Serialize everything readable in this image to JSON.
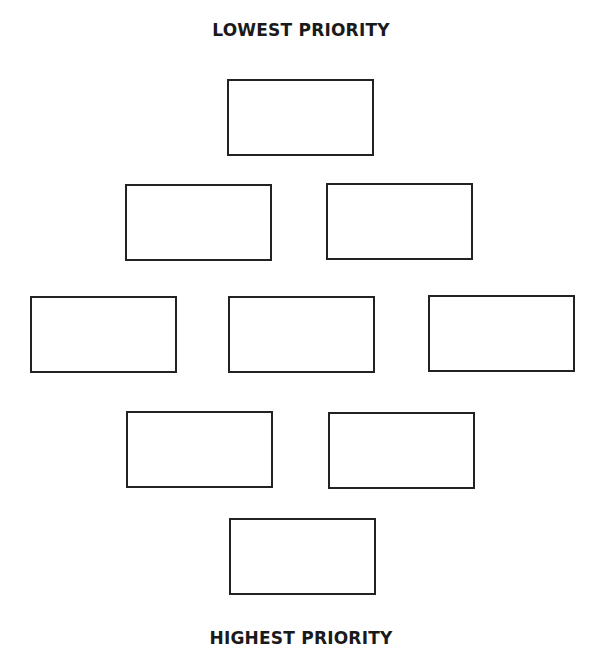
{
  "diagram": {
    "top_label": "LOWEST PRIORITY",
    "bottom_label": "HIGHEST PRIORITY",
    "layout": "diamond",
    "rows": [
      {
        "row": 1,
        "boxes": [
          {
            "text": ""
          }
        ]
      },
      {
        "row": 2,
        "boxes": [
          {
            "text": ""
          },
          {
            "text": ""
          }
        ]
      },
      {
        "row": 3,
        "boxes": [
          {
            "text": ""
          },
          {
            "text": ""
          },
          {
            "text": ""
          }
        ]
      },
      {
        "row": 4,
        "boxes": [
          {
            "text": ""
          },
          {
            "text": ""
          }
        ]
      },
      {
        "row": 5,
        "boxes": [
          {
            "text": ""
          }
        ]
      }
    ],
    "colors": {
      "border": "#222222",
      "text": "#1a1a1a",
      "background": "#ffffff"
    }
  }
}
